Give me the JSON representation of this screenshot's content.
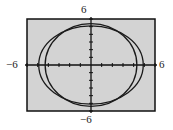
{
  "chart_data": {
    "type": "line",
    "title": "",
    "xlabel": "",
    "ylabel": "",
    "xlim": [
      -6,
      6
    ],
    "ylim": [
      -6,
      6
    ],
    "grid": false,
    "tick_labels": {
      "x_min": "−6",
      "x_max": "6",
      "y_min": "−6",
      "y_max": "6"
    },
    "ticks": {
      "x_step": 1,
      "y_step": 1
    },
    "series": [
      {
        "name": "curve-wide",
        "shape": "ellipse",
        "center": [
          0,
          0
        ],
        "rx": 4.9,
        "ry": 5.1
      },
      {
        "name": "curve-tall",
        "shape": "ellipse",
        "center": [
          0,
          0
        ],
        "rx": 4.3,
        "ry": 5.4
      }
    ],
    "colors": {
      "background": "#d3d3d3",
      "frame": "#111111",
      "curve": "#1a1a1a",
      "axis": "#111111"
    }
  }
}
